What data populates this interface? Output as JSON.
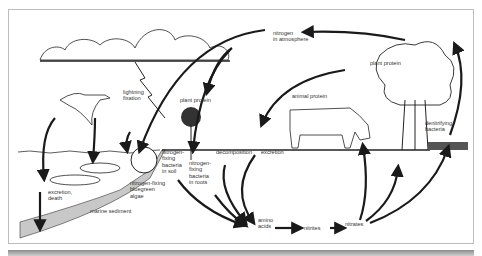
{
  "diagram": {
    "labels": {
      "nitrogen_atmosphere": "nitrogen\nin atmosphere",
      "lightning_fixation": "lightning\nfixation",
      "plant_protein_left": "plant protein",
      "plant_protein_tree": "plant protein",
      "animal_protein": "animal protein",
      "denitrifying_bacteria": "denitrifying\nbacteria",
      "nitrogen_fixing_soil": "nitrogen-\nfixing\nbacteria\nin soil",
      "nitrogen_fixing_roots": "nitrogen-\nfixing\nbacteria\nin roots",
      "decomposition": "decomposition",
      "excretion": "excretion",
      "blue_green_algae": "nitrogen-fixing\nbluegreen\nalgae",
      "excretion_death": "excretion,\ndeath",
      "marine_sediment": "marine sediment",
      "amino_acids": "amino\nacids",
      "nitrites": "nitrites",
      "nitrates": "nitrates"
    },
    "colors": {
      "line": "#1a1a1a",
      "sediment": "#c8c8c8",
      "frame": "#bdbdbd"
    }
  }
}
